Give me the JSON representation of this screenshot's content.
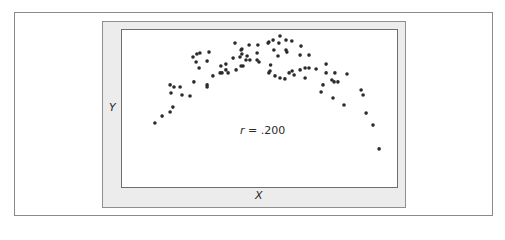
{
  "chart_data": {
    "type": "scatter",
    "title": "",
    "xlabel": "X",
    "ylabel": "Y",
    "annotation": {
      "variable": "r",
      "operator": "=",
      "value": ".200"
    },
    "grid": false,
    "legend": null,
    "xlim": [
      0,
      100
    ],
    "ylim": [
      0,
      100
    ],
    "point_color": "#2b2b2b",
    "frame_color": "#ececec",
    "points": [
      {
        "x": 12.3,
        "y": 40.5
      },
      {
        "x": 14.9,
        "y": 44.9
      },
      {
        "x": 17.8,
        "y": 47.5
      },
      {
        "x": 18.8,
        "y": 50.6
      },
      {
        "x": 17.8,
        "y": 64.6
      },
      {
        "x": 19.2,
        "y": 63.3
      },
      {
        "x": 21.4,
        "y": 63.3
      },
      {
        "x": 18.1,
        "y": 59.5
      },
      {
        "x": 22.1,
        "y": 58.2
      },
      {
        "x": 25.0,
        "y": 57.6
      },
      {
        "x": 26.4,
        "y": 66.5
      },
      {
        "x": 31.2,
        "y": 64.6
      },
      {
        "x": 31.2,
        "y": 63.3
      },
      {
        "x": 26.1,
        "y": 82.3
      },
      {
        "x": 27.5,
        "y": 84.2
      },
      {
        "x": 28.6,
        "y": 84.8
      },
      {
        "x": 31.9,
        "y": 85.4
      },
      {
        "x": 27.2,
        "y": 79.1
      },
      {
        "x": 28.3,
        "y": 75.3
      },
      {
        "x": 31.2,
        "y": 79.7
      },
      {
        "x": 33.3,
        "y": 70.3
      },
      {
        "x": 35.9,
        "y": 72.2
      },
      {
        "x": 36.6,
        "y": 72.2
      },
      {
        "x": 36.2,
        "y": 76.6
      },
      {
        "x": 38.0,
        "y": 77.8
      },
      {
        "x": 38.0,
        "y": 74.1
      },
      {
        "x": 38.8,
        "y": 72.2
      },
      {
        "x": 41.7,
        "y": 74.1
      },
      {
        "x": 43.5,
        "y": 76.6
      },
      {
        "x": 44.2,
        "y": 76.6
      },
      {
        "x": 40.6,
        "y": 81.6
      },
      {
        "x": 43.1,
        "y": 82.3
      },
      {
        "x": 43.8,
        "y": 84.2
      },
      {
        "x": 41.3,
        "y": 91.1
      },
      {
        "x": 43.5,
        "y": 86.7
      },
      {
        "x": 43.8,
        "y": 87.3
      },
      {
        "x": 46.4,
        "y": 89.9
      },
      {
        "x": 49.6,
        "y": 89.9
      },
      {
        "x": 45.7,
        "y": 82.9
      },
      {
        "x": 45.3,
        "y": 80.4
      },
      {
        "x": 46.7,
        "y": 80.4
      },
      {
        "x": 49.3,
        "y": 84.8
      },
      {
        "x": 49.3,
        "y": 80.4
      },
      {
        "x": 50.0,
        "y": 79.1
      },
      {
        "x": 53.3,
        "y": 91.1
      },
      {
        "x": 53.6,
        "y": 91.8
      },
      {
        "x": 55.1,
        "y": 93.0
      },
      {
        "x": 57.6,
        "y": 95.6
      },
      {
        "x": 57.2,
        "y": 91.1
      },
      {
        "x": 55.4,
        "y": 86.7
      },
      {
        "x": 56.9,
        "y": 82.9
      },
      {
        "x": 59.8,
        "y": 86.7
      },
      {
        "x": 60.1,
        "y": 85.4
      },
      {
        "x": 59.8,
        "y": 93.0
      },
      {
        "x": 61.9,
        "y": 92.4
      },
      {
        "x": 65.2,
        "y": 89.2
      },
      {
        "x": 64.9,
        "y": 83.5
      },
      {
        "x": 68.1,
        "y": 83.5
      },
      {
        "x": 54.2,
        "y": 77.2
      },
      {
        "x": 54.0,
        "y": 73.4
      },
      {
        "x": 53.6,
        "y": 72.2
      },
      {
        "x": 55.8,
        "y": 70.3
      },
      {
        "x": 57.6,
        "y": 69.0
      },
      {
        "x": 59.4,
        "y": 68.4
      },
      {
        "x": 60.9,
        "y": 72.2
      },
      {
        "x": 62.0,
        "y": 73.4
      },
      {
        "x": 62.7,
        "y": 70.9
      },
      {
        "x": 64.9,
        "y": 74.1
      },
      {
        "x": 66.7,
        "y": 75.3
      },
      {
        "x": 68.1,
        "y": 75.3
      },
      {
        "x": 66.7,
        "y": 69.0
      },
      {
        "x": 70.7,
        "y": 74.7
      },
      {
        "x": 74.3,
        "y": 77.8
      },
      {
        "x": 74.3,
        "y": 72.2
      },
      {
        "x": 77.5,
        "y": 72.2
      },
      {
        "x": 81.9,
        "y": 71.5
      },
      {
        "x": 76.4,
        "y": 67.7
      },
      {
        "x": 77.2,
        "y": 66.5
      },
      {
        "x": 78.6,
        "y": 66.5
      },
      {
        "x": 73.2,
        "y": 64.6
      },
      {
        "x": 72.5,
        "y": 60.1
      },
      {
        "x": 76.8,
        "y": 56.3
      },
      {
        "x": 80.8,
        "y": 51.9
      },
      {
        "x": 87.0,
        "y": 61.4
      },
      {
        "x": 87.7,
        "y": 58.2
      },
      {
        "x": 88.8,
        "y": 46.8
      },
      {
        "x": 91.3,
        "y": 39.2
      },
      {
        "x": 93.5,
        "y": 24.1
      }
    ]
  }
}
